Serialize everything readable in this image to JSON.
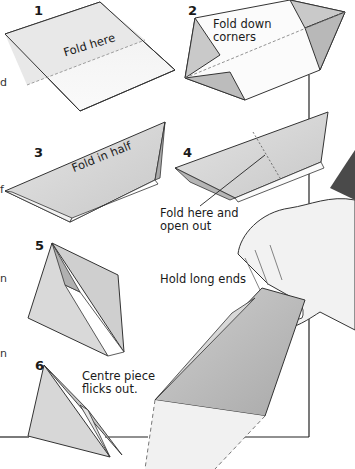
{
  "steps": [
    {
      "number": "1",
      "caption": "Fold here"
    },
    {
      "number": "2",
      "caption_line1": "Fold down",
      "caption_line2": "corners"
    },
    {
      "number": "3",
      "caption": "Fold in half"
    },
    {
      "number": "4",
      "caption_line1": "Fold here and",
      "caption_line2": "open out"
    },
    {
      "number": "5"
    },
    {
      "number": "6",
      "caption_line1": "Centre piece",
      "caption_line2": "flicks out."
    }
  ],
  "hold_caption": "Hold long ends",
  "left_edge_fragments": [
    "d",
    "f",
    "n",
    "n"
  ],
  "colors": {
    "paper": "#ffffff",
    "paper_shaded": "#d9d9d9",
    "paper_dark": "#bdbdbd",
    "outline": "#333333",
    "sleeve": "#4a4a4a"
  }
}
